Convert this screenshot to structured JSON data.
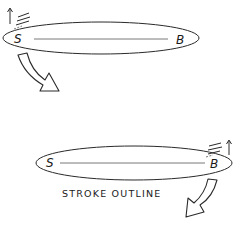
{
  "diagram": {
    "caption": "STROKE OUTLINE",
    "colors": {
      "ink": "#2a2a2a",
      "background": "#ffffff"
    },
    "panels": [
      {
        "id": "stroke-start",
        "start_label": "S",
        "end_label": "B",
        "motion_marker_position": "left",
        "rotation_arrow_direction": "down-right"
      },
      {
        "id": "stroke-end",
        "start_label": "S",
        "end_label": "B",
        "motion_marker_position": "right",
        "rotation_arrow_direction": "down-left"
      }
    ]
  }
}
